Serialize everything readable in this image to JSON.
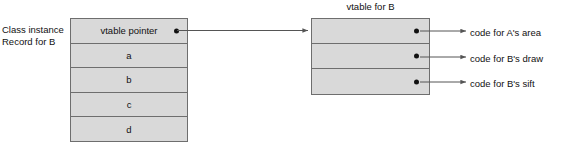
{
  "diagram": {
    "caption": {
      "line1": "Class instance",
      "line2": "Record for B"
    },
    "record_box": {
      "rows": [
        {
          "label": "vtable pointer",
          "has_pointer_dot": true
        },
        {
          "label": "a",
          "has_pointer_dot": false
        },
        {
          "label": "b",
          "has_pointer_dot": false
        },
        {
          "label": "c",
          "has_pointer_dot": false
        },
        {
          "label": "d",
          "has_pointer_dot": false
        }
      ]
    },
    "vtable": {
      "title": "vtable for B",
      "slots": [
        {
          "target": "code for A's area"
        },
        {
          "target": "code for B's draw"
        },
        {
          "target": "code for B's sift"
        }
      ]
    },
    "colors": {
      "box_fill": "#d9d9d9",
      "box_stroke": "#6e6e6e",
      "text": "#111111",
      "arrow": "#555555",
      "dot": "#111111",
      "background": "#ffffff"
    }
  }
}
